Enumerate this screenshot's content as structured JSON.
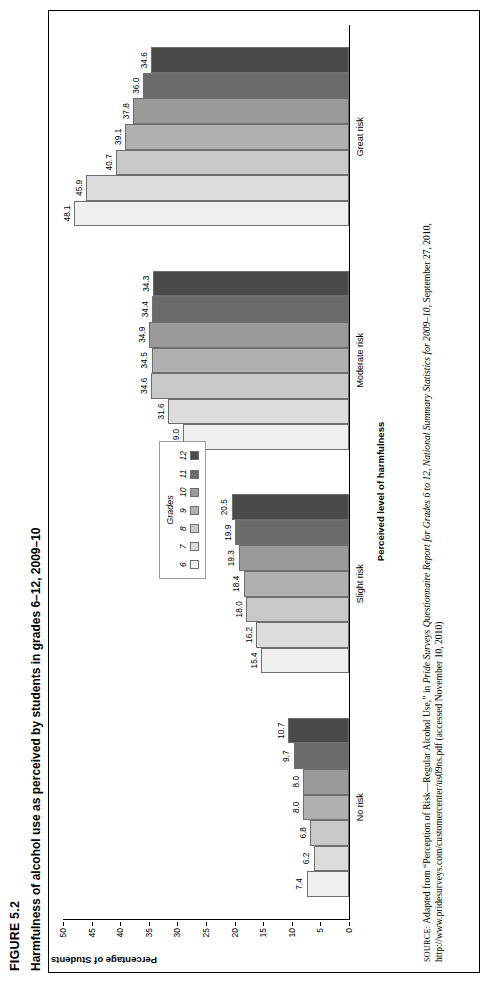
{
  "figure": {
    "number": "FIGURE 5.2",
    "title": "Harmfulness of alcohol use as perceived by students in grades 6–12, 2009–10"
  },
  "legend": {
    "title": "Grades",
    "items": [
      {
        "label": "6",
        "color": "#efefef"
      },
      {
        "label": "7",
        "color": "#dcdcdc"
      },
      {
        "label": "8",
        "color": "#c8c8c8"
      },
      {
        "label": "9",
        "color": "#b0b0b0"
      },
      {
        "label": "10",
        "color": "#9a9a9a"
      },
      {
        "label": "11",
        "color": "#6b6b6b"
      },
      {
        "label": "12",
        "color": "#4a4a4a"
      }
    ]
  },
  "axes": {
    "y_title": "Percentage of Students",
    "x_title": "Perceived level of harmfulness",
    "y_ticks": [
      "0",
      "5",
      "10",
      "15",
      "20",
      "25",
      "30",
      "35",
      "40",
      "45",
      "50"
    ]
  },
  "source": {
    "prefix": "SOURCE:",
    "text_1": " Adapted from “Perception of Risk—Regular Alcohol Use,” in ",
    "italic_1": "Pride Surveys Questionnaire Report for Grades 6 to 12, National Summary Statistics for 2009–10",
    "text_2": ", September 27, 2010, http://www.pridesurveys.com/customercenter/us09ns.pdf (accessed November 10, 2010)"
  },
  "chart_data": {
    "type": "bar",
    "title": "Harmfulness of alcohol use as perceived by students in grades 6–12, 2009–10",
    "xlabel": "Perceived level of harmfulness",
    "ylabel": "Percentage of Students",
    "ylim": [
      0,
      50
    ],
    "ytick_step": 5,
    "grid": false,
    "legend_position": "top-right-inside",
    "categories": [
      "No risk",
      "Slight risk",
      "Moderate risk",
      "Great risk"
    ],
    "series": [
      {
        "name": "6",
        "color": "#efefef",
        "values": [
          7.4,
          15.4,
          29.0,
          48.1
        ]
      },
      {
        "name": "7",
        "color": "#dcdcdc",
        "values": [
          6.2,
          16.2,
          31.6,
          45.9
        ]
      },
      {
        "name": "8",
        "color": "#c8c8c8",
        "values": [
          6.8,
          18.0,
          34.6,
          40.7
        ]
      },
      {
        "name": "9",
        "color": "#b0b0b0",
        "values": [
          8.0,
          18.4,
          34.5,
          39.1
        ]
      },
      {
        "name": "10",
        "color": "#9a9a9a",
        "values": [
          8.0,
          19.3,
          34.9,
          37.8
        ]
      },
      {
        "name": "11",
        "color": "#6b6b6b",
        "values": [
          9.7,
          19.9,
          34.4,
          36.0
        ]
      },
      {
        "name": "12",
        "color": "#4a4a4a",
        "values": [
          10.7,
          20.5,
          34.3,
          34.6
        ]
      }
    ]
  }
}
